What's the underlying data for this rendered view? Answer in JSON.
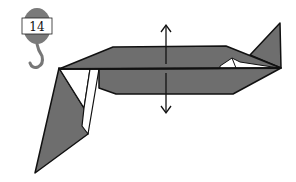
{
  "diagram": {
    "type": "origami-step",
    "step_badge": {
      "number": "14",
      "icon": "hanger-hook-icon"
    },
    "annotations": [
      {
        "type": "double-headed-arrow",
        "direction": "vertical",
        "meaning": "open / spread layers"
      }
    ],
    "colors": {
      "paper_colored": "#6e6e6e",
      "paper_white": "#ffffff",
      "outline": "#111111",
      "badge_gray": "#7a7a7a"
    }
  }
}
